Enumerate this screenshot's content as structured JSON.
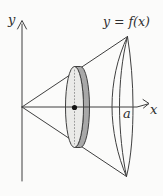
{
  "figure": {
    "labels": {
      "y_axis": "y",
      "x_axis": "x",
      "function_curve": "y = f(x)",
      "base_radius": "a"
    },
    "colors": {
      "line": "#3f3f3f",
      "disk_rim_fill": "#a8a8a8",
      "disk_face_fill": "#eaeae8",
      "disk_dot_line": "#9a9a9a",
      "center_dot": "#141414",
      "background": "#fbfbfa"
    }
  }
}
